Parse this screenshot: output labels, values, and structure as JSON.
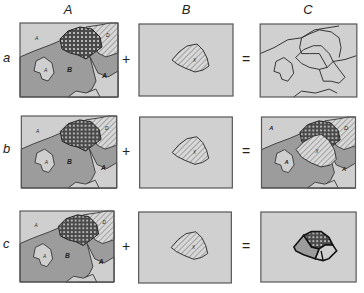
{
  "columns": [
    {
      "label": "A"
    },
    {
      "label": "B"
    },
    {
      "label": "C"
    }
  ],
  "rows": [
    {
      "label": "a",
      "plus": "+",
      "equals": "=",
      "result": "boundaries-only"
    },
    {
      "label": "b",
      "plus": "+",
      "equals": "=",
      "result": "overlay-update"
    },
    {
      "label": "c",
      "plus": "+",
      "equals": "=",
      "result": "intersection-clip"
    }
  ],
  "map_labels": {
    "layerA": {
      "a_top": "A",
      "a_island": "A",
      "b_main": "B",
      "a_right": "A",
      "d_hatched": "D"
    },
    "layerB": {
      "x_poly": "X"
    },
    "result_b": {
      "a_top": "A",
      "a_island": "A",
      "a_right": "A",
      "d_hatched": "D",
      "x_poly": "X"
    }
  },
  "colors": {
    "light_region": "#cfcfcf",
    "dark_region": "#9c9c9c",
    "dotted_fill": "#555555",
    "outline": "#333333",
    "frame": "#555555"
  }
}
